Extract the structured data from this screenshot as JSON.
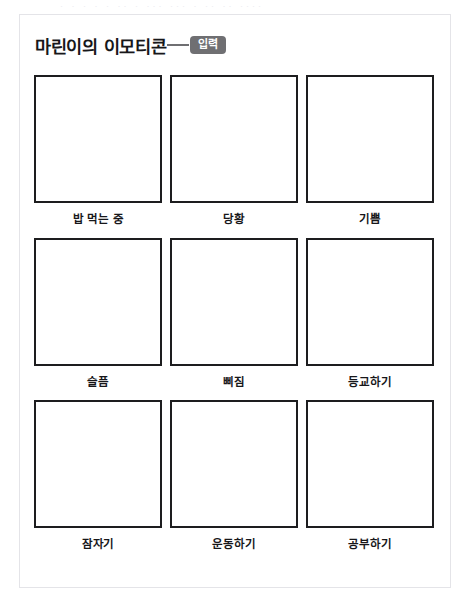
{
  "page": {
    "ghost_text": "· · · · ·  ·· · ··· ···  · ·· ·· ····",
    "background_color": "#ffffff",
    "card_border_color": "#e4e4e8"
  },
  "header": {
    "title": "마린이의 이모티콘",
    "badge_label": "입력",
    "badge_color": "#6f6f72",
    "badge_text_color": "#ffffff",
    "connector_color": "#6f6f72"
  },
  "worksheet": {
    "box_border_color": "#1d1d1f",
    "box_fill_color": "#ffffff",
    "rows": [
      {
        "cells": [
          {
            "label": "밥 먹는 중"
          },
          {
            "label": "당황"
          },
          {
            "label": "기쁨"
          }
        ]
      },
      {
        "cells": [
          {
            "label": "슬픔"
          },
          {
            "label": "삐짐"
          },
          {
            "label": "등교하기"
          }
        ]
      },
      {
        "cells": [
          {
            "label": "잠자기"
          },
          {
            "label": "운동하기"
          },
          {
            "label": "공부하기"
          }
        ]
      }
    ]
  }
}
